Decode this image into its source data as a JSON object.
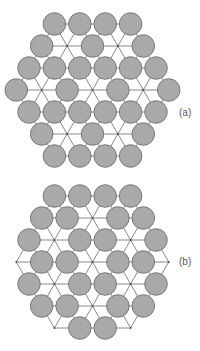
{
  "figure": {
    "style": {
      "background": "#ffffff",
      "circle_fill": "#a9a9a9",
      "circle_stroke": "#666666",
      "line_color": "#7a7a7a",
      "circle_radius": 11.3,
      "lattice_spacing": 25.4,
      "row_height": 22
    },
    "panels": [
      {
        "id": "a",
        "label": "(a)",
        "label_pos": {
          "x": 179,
          "y": 107
        },
        "center": {
          "x": 92.5,
          "y": 90
        },
        "description": "Hexagonal patch of triangular lattice; 27 sites occupied by spheres, 10 lattice sites vacant (line intersections)",
        "rows": [
          {
            "offset": -3,
            "sites": [
              1,
              1,
              1,
              1
            ]
          },
          {
            "offset": -2,
            "sites": [
              1,
              0,
              1,
              0,
              1
            ]
          },
          {
            "offset": -1,
            "sites": [
              1,
              1,
              1,
              1,
              1,
              1
            ]
          },
          {
            "offset": 0,
            "sites": [
              1,
              0,
              1,
              0,
              1,
              0,
              1
            ]
          },
          {
            "offset": 1,
            "sites": [
              1,
              1,
              1,
              1,
              1,
              1
            ]
          },
          {
            "offset": 2,
            "sites": [
              1,
              0,
              1,
              0,
              1
            ]
          },
          {
            "offset": 3,
            "sites": [
              1,
              1,
              1,
              1
            ]
          }
        ]
      },
      {
        "id": "b",
        "label": "(b)",
        "label_pos": {
          "x": 179,
          "y": 256
        },
        "center": {
          "x": 92.5,
          "y": 262
        },
        "description": "Hexagonal patch of triangular lattice; 24 sites occupied by spheres, 13 lattice sites vacant (line intersections)",
        "rows": [
          {
            "offset": -3,
            "sites": [
              1,
              1,
              1,
              1
            ]
          },
          {
            "offset": -2,
            "sites": [
              1,
              1,
              0,
              1,
              1
            ]
          },
          {
            "offset": -1,
            "sites": [
              1,
              0,
              1,
              1,
              0,
              1
            ]
          },
          {
            "offset": 0,
            "sites": [
              0,
              1,
              1,
              0,
              1,
              1,
              0
            ]
          },
          {
            "offset": 1,
            "sites": [
              1,
              0,
              1,
              1,
              0,
              1
            ]
          },
          {
            "offset": 2,
            "sites": [
              1,
              1,
              0,
              1,
              1
            ]
          },
          {
            "offset": 3,
            "sites": [
              0,
              1,
              1,
              0
            ]
          }
        ]
      }
    ]
  }
}
